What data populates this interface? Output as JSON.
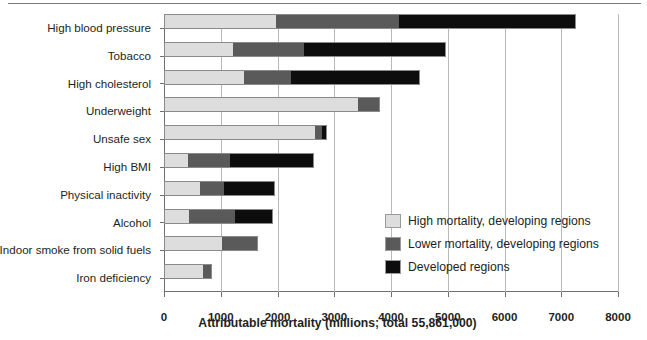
{
  "chart_data": {
    "type": "bar",
    "orientation": "horizontal",
    "stacked": true,
    "title": "",
    "xlabel": "Attributable mortality (millions; total 55,861,000)",
    "ylabel": "",
    "xlim": [
      0,
      8000
    ],
    "xticks": [
      0,
      1000,
      2000,
      3000,
      4000,
      5000,
      6000,
      7000,
      8000
    ],
    "xticklabels": [
      "0",
      "1000",
      "2000",
      "3000",
      "4000",
      "5000",
      "6000",
      "7000",
      "8000"
    ],
    "grid": "vertical",
    "legend_position": "inside-right",
    "categories": [
      "High blood pressure",
      "Tobacco",
      "High cholesterol",
      "Underweight",
      "Unsafe sex",
      "High BMI",
      "Physical inactivity",
      "Alcohol",
      "Indoor smoke from solid fuels",
      "Iron deficiency"
    ],
    "series": [
      {
        "name": "High mortality, developing regions",
        "color": "#dddddd",
        "values": [
          1975,
          1210,
          1405,
          3425,
          2665,
          425,
          635,
          445,
          1020,
          680
        ]
      },
      {
        "name": "Lower mortality, developing regions",
        "color": "#5a5a5a",
        "values": [
          2165,
          1255,
          830,
          380,
          125,
          740,
          420,
          805,
          640,
          170
        ]
      },
      {
        "name": "Developed regions",
        "color": "#0d0d0d",
        "values": [
          3120,
          2500,
          2270,
          0,
          90,
          1485,
          900,
          665,
          0,
          0
        ]
      }
    ],
    "totals": [
      7260,
      4965,
      4505,
      3805,
      2880,
      2650,
      1955,
      1915,
      1660,
      850
    ]
  }
}
